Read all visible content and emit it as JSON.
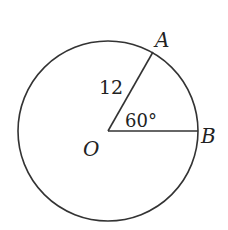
{
  "diagram": {
    "type": "circle-sector",
    "stroke_color": "#333333",
    "circle": {
      "center_label": "O",
      "cx": 108,
      "cy": 131,
      "r": 90
    },
    "points": {
      "A": {
        "label": "A",
        "x": 153,
        "y": 52
      },
      "B": {
        "label": "B",
        "x": 197,
        "y": 131
      },
      "O": {
        "label": "O",
        "x": 108,
        "y": 131
      }
    },
    "segments": [
      {
        "from": "O",
        "to": "A",
        "length_label": "12"
      },
      {
        "from": "O",
        "to": "B"
      }
    ],
    "angle": {
      "label": "60°",
      "vertex": "O",
      "between": [
        "A",
        "B"
      ]
    }
  }
}
